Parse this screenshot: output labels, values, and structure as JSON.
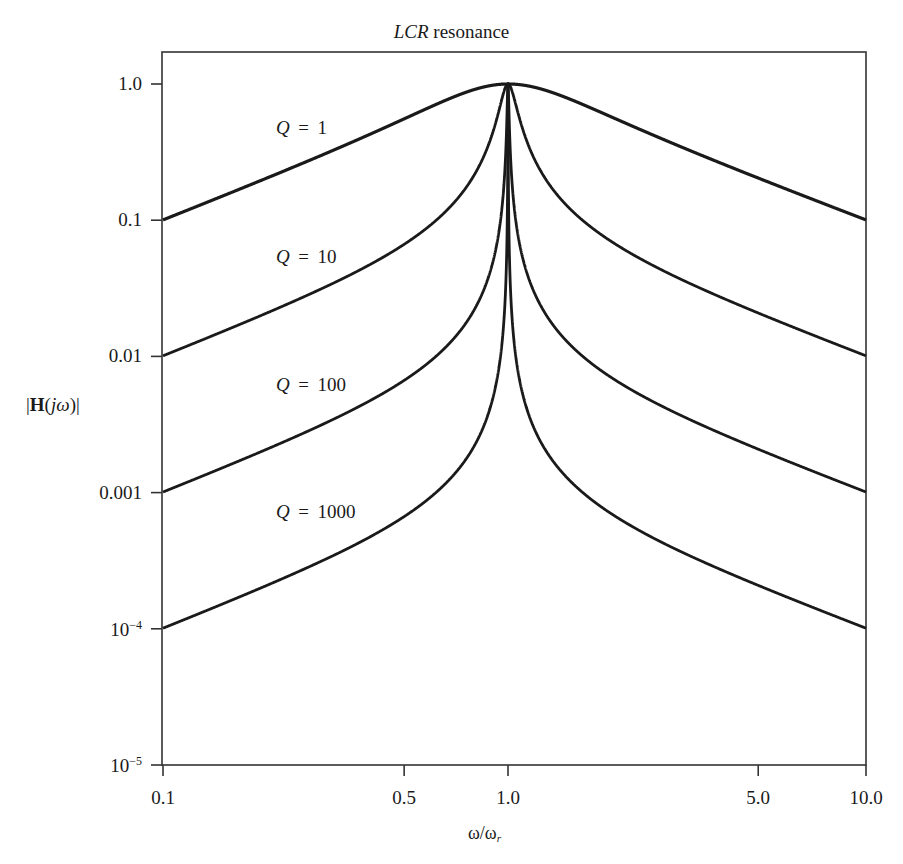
{
  "title_italic": "LCR",
  "title_rest": " resonance",
  "ylabel": {
    "pre": "|",
    "bold": "H",
    "open": "(",
    "italic": "jω",
    "close": ")|"
  },
  "xlabel": {
    "main": "ω/ω",
    "sub": "r"
  },
  "y_ticks": [
    {
      "value": 1.0,
      "label": "1.0",
      "sup": ""
    },
    {
      "value": 0.1,
      "label": "0.1",
      "sup": ""
    },
    {
      "value": 0.01,
      "label": "0.01",
      "sup": ""
    },
    {
      "value": 0.001,
      "label": "0.001",
      "sup": ""
    },
    {
      "value": 0.0001,
      "label": "10",
      "sup": "−4"
    },
    {
      "value": 1e-05,
      "label": "10",
      "sup": "−5"
    }
  ],
  "x_ticks": [
    {
      "value": 0.1,
      "label": "0.1"
    },
    {
      "value": 0.5,
      "label": "0.5"
    },
    {
      "value": 1.0,
      "label": "1.0"
    },
    {
      "value": 5.0,
      "label": "5.0"
    },
    {
      "value": 10.0,
      "label": "10.0"
    }
  ],
  "q_labels": [
    {
      "Q": "Q",
      "text": " = 1",
      "left": 276,
      "top": 118
    },
    {
      "Q": "Q",
      "text": " = 10",
      "left": 276,
      "top": 247
    },
    {
      "Q": "Q",
      "text": " = 100",
      "left": 276,
      "top": 375
    },
    {
      "Q": "Q",
      "text": " = 1000",
      "left": 276,
      "top": 502
    }
  ],
  "colors": {
    "line": "#1a1a1a",
    "axis": "#333333",
    "background": "#ffffff"
  },
  "chart_data": {
    "type": "line",
    "title": "LCR resonance",
    "xlabel": "ω/ω_r",
    "ylabel": "|H(jω)|",
    "xscale": "log",
    "yscale": "log",
    "xlim": [
      0.1,
      10.0
    ],
    "ylim": [
      1e-05,
      1.0
    ],
    "grid": false,
    "legend": "inline labels left of peak",
    "x_tick_labels": [
      "0.1",
      "0.5",
      "1.0",
      "5.0",
      "10.0"
    ],
    "y_tick_labels": [
      "1.0",
      "0.1",
      "0.01",
      "0.001",
      "10^-4",
      "10^-5"
    ],
    "x": [
      0.1,
      0.2,
      0.3,
      0.5,
      0.7,
      0.9,
      0.95,
      1.0,
      1.05,
      1.1,
      1.5,
      2.0,
      3.0,
      5.0,
      7.0,
      10.0
    ],
    "series": [
      {
        "name": "Q = 1",
        "Q": 1,
        "values": [
          0.1005,
          0.2039,
          0.3131,
          0.5547,
          0.8082,
          0.9784,
          0.9948,
          1.0,
          0.9953,
          0.9823,
          0.7682,
          0.5547,
          0.3511,
          0.2039,
          0.1443,
          0.1005
        ]
      },
      {
        "name": "Q = 10",
        "Q": 10,
        "values": [
          0.0101,
          0.0208,
          0.0329,
          0.0665,
          0.136,
          0.4282,
          0.6981,
          1.0,
          0.7153,
          0.464,
          0.1191,
          0.0665,
          0.0375,
          0.0208,
          0.0146,
          0.0101
        ]
      },
      {
        "name": "Q = 100",
        "Q": 100,
        "values": [
          0.00101,
          0.00208,
          0.0033,
          0.00667,
          0.01372,
          0.04732,
          0.09699,
          1.0,
          0.1019,
          0.05231,
          0.012,
          0.00667,
          0.00375,
          0.00208,
          0.00146,
          0.00101
        ]
      },
      {
        "name": "Q = 1000",
        "Q": 1000,
        "values": [
          0.000101,
          0.000208,
          0.00033,
          0.000667,
          0.001372,
          0.004737,
          0.009747,
          1.0,
          0.01025,
          0.005238,
          0.0012,
          0.000667,
          0.000375,
          0.000208,
          0.000146,
          0.000101
        ]
      }
    ],
    "formula": "|H| = 1 / sqrt(1 + Q^2 (x - 1/x)^2)"
  }
}
